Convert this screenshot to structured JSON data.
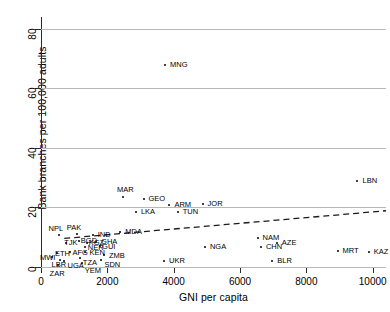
{
  "chart_data": {
    "type": "scatter",
    "title": "",
    "xlabel": "GNI per capita",
    "ylabel": "Bank branches per 100,000 adults",
    "xlim": [
      0,
      10400
    ],
    "ylim": [
      0,
      84
    ],
    "xticks": [
      0,
      2000,
      4000,
      6000,
      8000,
      10000
    ],
    "xtick_labels": [
      "0",
      "2000",
      "4000",
      "6000",
      "8000",
      "10000"
    ],
    "yticks": [
      0,
      20,
      40,
      60,
      80
    ],
    "ytick_labels": [
      "0",
      "20",
      "40",
      "60",
      "80"
    ],
    "grid": "horizontal",
    "legend": "none",
    "marker": "small filled circle",
    "point_label_font_size": 7.5,
    "points": [
      {
        "label": "MNG",
        "x": 3740,
        "y": 68.0,
        "label_dx": 5,
        "label_dy": -4
      },
      {
        "label": "LBN",
        "x": 9540,
        "y": 28.8,
        "label_dx": 5,
        "label_dy": -4
      },
      {
        "label": "MAR",
        "x": 2470,
        "y": 23.5,
        "label_dx": -6,
        "label_dy": -11
      },
      {
        "label": "GEO",
        "x": 3090,
        "y": 23.0,
        "label_dx": 5,
        "label_dy": -4
      },
      {
        "label": "ARM",
        "x": 3870,
        "y": 21.0,
        "label_dx": 5,
        "label_dy": -4
      },
      {
        "label": "JOR",
        "x": 4870,
        "y": 21.3,
        "label_dx": 5,
        "label_dy": -4
      },
      {
        "label": "LKA",
        "x": 2860,
        "y": 18.6,
        "label_dx": 5,
        "label_dy": -4
      },
      {
        "label": "TUN",
        "x": 4120,
        "y": 18.4,
        "label_dx": 5,
        "label_dy": -4
      },
      {
        "label": "NAM",
        "x": 6530,
        "y": 9.8,
        "label_dx": 5,
        "label_dy": -4
      },
      {
        "label": "AZE",
        "x": 7110,
        "y": 7.9,
        "label_dx": 5,
        "label_dy": -4
      },
      {
        "label": "CHN",
        "x": 6630,
        "y": 6.8,
        "label_dx": 5,
        "label_dy": -4
      },
      {
        "label": "MRT",
        "x": 8940,
        "y": 5.4,
        "label_dx": 5,
        "label_dy": -4
      },
      {
        "label": "KAZ",
        "x": 9880,
        "y": 5.2,
        "label_dx": 5,
        "label_dy": -4
      },
      {
        "label": "BLR",
        "x": 6970,
        "y": 2.1,
        "label_dx": 5,
        "label_dy": -4
      },
      {
        "label": "UKR",
        "x": 3710,
        "y": 2.1,
        "label_dx": 5,
        "label_dy": -4
      },
      {
        "label": "NGA",
        "x": 4940,
        "y": 6.6,
        "label_dx": 5,
        "label_dy": -4
      },
      {
        "label": "MDA",
        "x": 2390,
        "y": 11.6,
        "label_dx": 5,
        "label_dy": -4
      },
      {
        "label": "IND",
        "x": 1560,
        "y": 10.8,
        "label_dx": 5,
        "label_dy": -4
      },
      {
        "label": "PAK",
        "x": 1080,
        "y": 11.0,
        "label_dx": -10,
        "label_dy": -10
      },
      {
        "label": "NPL",
        "x": 530,
        "y": 10.6,
        "label_dx": -10,
        "label_dy": -10
      },
      {
        "label": "BGD",
        "x": 1140,
        "y": 8.7,
        "label_dx": 2,
        "label_dy": -4
      },
      {
        "label": "GHA",
        "x": 1660,
        "y": 8.4,
        "label_dx": 5,
        "label_dy": -4
      },
      {
        "label": "KGZ",
        "x": 1380,
        "y": 8.0,
        "label_dx": 2,
        "label_dy": -4
      },
      {
        "label": "TJK",
        "x": 760,
        "y": 7.9,
        "label_dx": -2,
        "label_dy": -4
      },
      {
        "label": "GUI",
        "x": 1780,
        "y": 7.0,
        "label_dx": 2,
        "label_dy": -3
      },
      {
        "label": "NER",
        "x": 1320,
        "y": 6.6,
        "label_dx": 0,
        "label_dy": -3
      },
      {
        "label": "KEN",
        "x": 1340,
        "y": 5.2,
        "label_dx": 4,
        "label_dy": -3
      },
      {
        "label": "AFG",
        "x": 860,
        "y": 5.0,
        "label_dx": 0,
        "label_dy": -3
      },
      {
        "label": "ETH",
        "x": 480,
        "y": 4.8,
        "label_dx": -2,
        "label_dy": -3
      },
      {
        "label": "ZMB",
        "x": 1900,
        "y": 4.2,
        "label_dx": 5,
        "label_dy": -3
      },
      {
        "label": "MWI",
        "x": 330,
        "y": 3.2,
        "label_dx": -12,
        "label_dy": -3
      },
      {
        "label": "TZA",
        "x": 1170,
        "y": 2.9,
        "label_dx": 0,
        "label_dy": 1
      },
      {
        "label": "SDN",
        "x": 1820,
        "y": 2.2,
        "label_dx": 0,
        "label_dy": 1
      },
      {
        "label": "UGA",
        "x": 680,
        "y": 2.0,
        "label_dx": 4,
        "label_dy": 1
      },
      {
        "label": "LBR",
        "x": 560,
        "y": 2.2,
        "label_dx": -8,
        "label_dy": 1
      },
      {
        "label": "YEM",
        "x": 1230,
        "y": 1.2,
        "label_dx": 0,
        "label_dy": 4
      },
      {
        "label": "ZAR",
        "x": 500,
        "y": 0.8,
        "label_dx": -8,
        "label_dy": 5
      }
    ],
    "trendline": {
      "style": "dashed",
      "x_start": 700,
      "y_start": 9.6,
      "x_end": 10400,
      "y_end": 18.9
    }
  }
}
